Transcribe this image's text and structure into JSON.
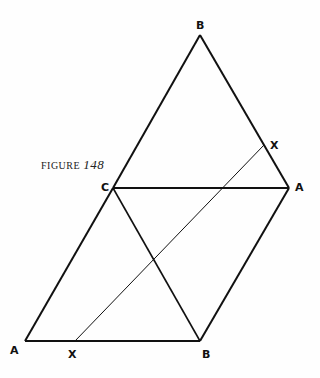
{
  "figure": {
    "caption_prefix": "FIGURE",
    "caption_number": "148"
  },
  "labels": {
    "b_top": "B",
    "x_upper": "X",
    "c_mid": "C",
    "a_right": "A",
    "a_bottom": "A",
    "x_bottom": "X",
    "b_bottom": "B"
  },
  "points": {
    "B_top": [
      200,
      35
    ],
    "C": [
      113,
      188
    ],
    "A_right": [
      289,
      188
    ],
    "X_upper": [
      264,
      145
    ],
    "A_bottom": [
      25,
      341
    ],
    "X_bottom": [
      75,
      341
    ],
    "B_bottom": [
      200,
      341
    ]
  },
  "colors": {
    "line": "#111111",
    "background": "#fefefe"
  }
}
